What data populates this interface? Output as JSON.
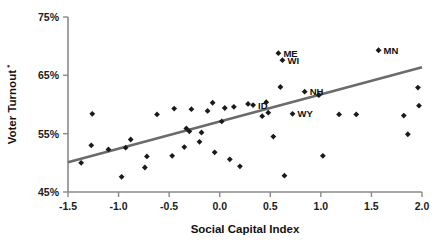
{
  "chart_data": {
    "type": "scatter",
    "title": "",
    "xlabel": "Social Capital Index",
    "ylabel": "Voter Turnout",
    "ylabel_superscript": "*",
    "xlim": [
      -1.5,
      2.0
    ],
    "ylim": [
      45,
      75
    ],
    "grid": false,
    "legend": false,
    "xticks": [
      "-1.5",
      "-1.0",
      "-0.5",
      "0.0",
      "0.5",
      "1.0",
      "1.5",
      "2.0"
    ],
    "xtick_values": [
      -1.5,
      -1.0,
      -0.5,
      0.0,
      0.5,
      1.0,
      1.5,
      2.0
    ],
    "yticks": [
      "45%",
      "55%",
      "65%",
      "75%"
    ],
    "ytick_values": [
      45,
      55,
      65,
      75
    ],
    "marker_color": "#1a1a1a",
    "trendline_color": "#6b6b6b",
    "axis_color": "#8a8a8a",
    "trendline": {
      "x": [
        -1.5,
        2.0
      ],
      "y": [
        50.1,
        66.4
      ]
    },
    "points": [
      {
        "x": -1.37,
        "y": 50.0,
        "label": ""
      },
      {
        "x": -1.27,
        "y": 53.0,
        "label": ""
      },
      {
        "x": -1.26,
        "y": 58.4,
        "label": ""
      },
      {
        "x": -1.1,
        "y": 52.3,
        "label": ""
      },
      {
        "x": -0.97,
        "y": 47.6,
        "label": ""
      },
      {
        "x": -0.93,
        "y": 52.6,
        "label": ""
      },
      {
        "x": -0.88,
        "y": 54.0,
        "label": ""
      },
      {
        "x": -0.74,
        "y": 49.2,
        "label": ""
      },
      {
        "x": -0.72,
        "y": 51.1,
        "label": ""
      },
      {
        "x": -0.62,
        "y": 58.3,
        "label": ""
      },
      {
        "x": -0.47,
        "y": 51.2,
        "label": ""
      },
      {
        "x": -0.45,
        "y": 59.3,
        "label": ""
      },
      {
        "x": -0.35,
        "y": 52.7,
        "label": ""
      },
      {
        "x": -0.33,
        "y": 55.9,
        "label": ""
      },
      {
        "x": -0.3,
        "y": 55.4,
        "label": ""
      },
      {
        "x": -0.28,
        "y": 59.2,
        "label": ""
      },
      {
        "x": -0.2,
        "y": 53.6,
        "label": ""
      },
      {
        "x": -0.18,
        "y": 55.2,
        "label": ""
      },
      {
        "x": -0.12,
        "y": 58.9,
        "label": ""
      },
      {
        "x": -0.07,
        "y": 60.3,
        "label": ""
      },
      {
        "x": -0.05,
        "y": 51.8,
        "label": ""
      },
      {
        "x": 0.02,
        "y": 57.1,
        "label": ""
      },
      {
        "x": 0.05,
        "y": 59.4,
        "label": ""
      },
      {
        "x": 0.1,
        "y": 50.6,
        "label": ""
      },
      {
        "x": 0.14,
        "y": 59.6,
        "label": ""
      },
      {
        "x": 0.2,
        "y": 49.4,
        "label": ""
      },
      {
        "x": 0.28,
        "y": 60.1,
        "label": ""
      },
      {
        "x": 0.33,
        "y": 59.9,
        "label": "ID"
      },
      {
        "x": 0.42,
        "y": 58.0,
        "label": ""
      },
      {
        "x": 0.46,
        "y": 60.4,
        "label": ""
      },
      {
        "x": 0.48,
        "y": 58.6,
        "label": ""
      },
      {
        "x": 0.53,
        "y": 54.5,
        "label": ""
      },
      {
        "x": 0.58,
        "y": 68.8,
        "label": "ME"
      },
      {
        "x": 0.62,
        "y": 67.6,
        "label": "WI"
      },
      {
        "x": 0.6,
        "y": 63.0,
        "label": ""
      },
      {
        "x": 0.64,
        "y": 47.8,
        "label": ""
      },
      {
        "x": 0.72,
        "y": 58.4,
        "label": "WY"
      },
      {
        "x": 0.84,
        "y": 62.2,
        "label": "NH"
      },
      {
        "x": 0.98,
        "y": 61.6,
        "label": ""
      },
      {
        "x": 1.02,
        "y": 51.2,
        "label": ""
      },
      {
        "x": 1.18,
        "y": 58.3,
        "label": ""
      },
      {
        "x": 1.35,
        "y": 58.3,
        "label": ""
      },
      {
        "x": 1.57,
        "y": 69.3,
        "label": "MN"
      },
      {
        "x": 1.82,
        "y": 58.1,
        "label": ""
      },
      {
        "x": 1.86,
        "y": 54.9,
        "label": ""
      },
      {
        "x": 1.96,
        "y": 62.9,
        "label": ""
      },
      {
        "x": 1.97,
        "y": 59.8,
        "label": ""
      }
    ]
  }
}
